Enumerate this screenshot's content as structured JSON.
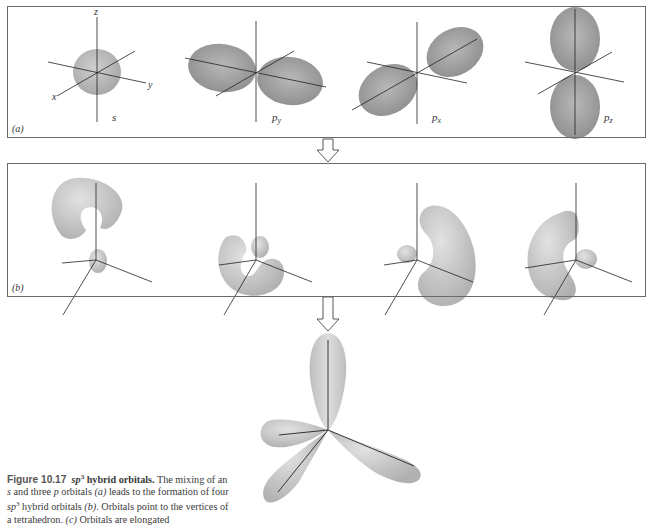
{
  "figure": {
    "panel_a": {
      "label": "(a)",
      "orbitals": [
        {
          "name": "s",
          "label": "s"
        },
        {
          "name": "py",
          "label": "p",
          "subscript": "y"
        },
        {
          "name": "px",
          "label": "p",
          "subscript": "x"
        },
        {
          "name": "pz",
          "label": "p",
          "subscript": "z"
        }
      ],
      "axis_labels": {
        "x": "x",
        "y": "y",
        "z": "z"
      }
    },
    "panel_b": {
      "label": "(b)",
      "orbital_count": 4,
      "description": "four sp3 hybrid orbitals"
    },
    "panel_c": {
      "description": "tetrahedral arrangement of elongated sp3 orbitals"
    },
    "colors": {
      "border": "#6a6a6a",
      "lobe_dark": "#9a9a9a",
      "lobe_light": "#d4d4d4",
      "axis": "#222222"
    }
  },
  "caption": {
    "figure_number": "Figure 10.17",
    "title_italic": "sp",
    "title_sup": "3",
    "title_rest": " hybrid orbitals.",
    "line1_rest": " The mixing of an",
    "line2": {
      "s": "s",
      "t1": " and three ",
      "p": "p",
      "t2": " orbitals ",
      "a": "(a)",
      "t3": " leads to the formation of four"
    },
    "line3": {
      "sp": "sp",
      "sup": "3",
      "t1": " hybrid orbitals ",
      "b": "(b)",
      "t2": ". Orbitals point to the vertices of"
    },
    "line4": {
      "t1": "a tetrahedron. ",
      "c": "(c)",
      "t2": " Orbitals are elongated"
    }
  }
}
